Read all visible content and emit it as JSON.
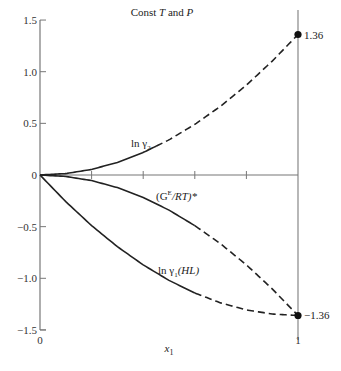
{
  "chart_data": {
    "type": "line",
    "title": "Const T and P",
    "title_parts": {
      "prefix": "Const ",
      "t": "T",
      "mid": " and ",
      "p": "P"
    },
    "xlabel": "x",
    "xlabel_sub": "1",
    "ylabel": "",
    "xlim": [
      0,
      1
    ],
    "ylim": [
      -1.5,
      1.5
    ],
    "x_ticks": [
      0,
      0.2,
      0.4,
      0.6,
      0.8,
      1
    ],
    "x_tick_labels": [
      "0",
      "",
      "",
      "",
      "",
      "1"
    ],
    "y_ticks": [
      1.5,
      1.0,
      0.5,
      0,
      -0.5,
      -1.0,
      -1.5
    ],
    "y_tick_labels": [
      "1.5",
      "1.0",
      "0.5",
      "0",
      "−0.5",
      "−1.0",
      "−1.5"
    ],
    "grid": false,
    "legend": "inline labels",
    "annotations": [
      {
        "text": "1.36",
        "x": 1,
        "y": 1.36
      },
      {
        "text": "−1.36",
        "x": 1,
        "y": -1.36
      }
    ],
    "endpoint_markers": [
      {
        "x": 1,
        "y": 1.36
      },
      {
        "x": 1,
        "y": -1.36
      }
    ],
    "x": [
      0,
      0.1,
      0.2,
      0.3,
      0.4,
      0.5,
      0.6,
      0.7,
      0.8,
      0.9,
      1.0
    ],
    "series": [
      {
        "name": "ln γ₂",
        "label_main": "ln γ",
        "label_sub": "2",
        "values": [
          0,
          0.014,
          0.054,
          0.122,
          0.218,
          0.34,
          0.49,
          0.666,
          0.87,
          1.102,
          1.36
        ],
        "solid_until_x": 0.45,
        "style": "solid then dashed"
      },
      {
        "name": "(Gᴱ/RT)*",
        "label_main": "(G",
        "label_sup": "E",
        "label_tail": "/RT)*",
        "values": [
          0,
          -0.014,
          -0.054,
          -0.122,
          -0.218,
          -0.34,
          -0.49,
          -0.666,
          -0.87,
          -1.102,
          -1.36
        ],
        "solid_until_x": 0.6,
        "style": "solid then dashed"
      },
      {
        "name": "ln γ₁(HL)",
        "label_main": "ln γ",
        "label_sub": "1",
        "label_tail": "(HL)",
        "values": [
          0,
          -0.258,
          -0.49,
          -0.694,
          -0.87,
          -1.02,
          -1.142,
          -1.238,
          -1.306,
          -1.346,
          -1.36
        ],
        "solid_until_x": 0.6,
        "style": "solid then dashed"
      }
    ]
  }
}
